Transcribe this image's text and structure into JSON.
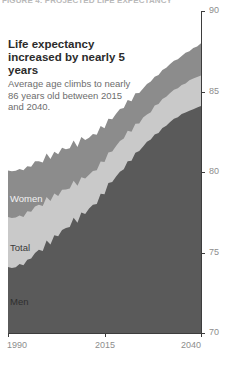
{
  "kicker": "FIGURE 4: PROJECTED LIFE EXPECTANCY",
  "headline": "Life expectancy increased by nearly 5 years",
  "deck": "Average age climbs to nearly 86 years old between 2015 and 2040.",
  "colors": {
    "women_band": "#8c8c8c",
    "total_band": "#c9c9c9",
    "men_band": "#5a5a5a",
    "axis": "#3d3d3d",
    "tick_label": "#8d8d8d",
    "headline_text": "#2b2b2b",
    "deck_text": "#6d6d6d",
    "background": "#ffffff"
  },
  "chart_data": {
    "type": "area",
    "title": "Life expectancy increased by nearly 5 years",
    "subtitle": "Average age climbs to nearly 86 years old between 2015 and 2040.",
    "xlabel": "",
    "ylabel": "",
    "xlim": [
      1990,
      2040
    ],
    "ylim": [
      70,
      90
    ],
    "xticks": [
      1990,
      2015,
      2040
    ],
    "yticks": [
      70,
      75,
      80,
      85,
      90
    ],
    "grid": false,
    "legend": "in-plot labels",
    "stacked": false,
    "note": "Three overlapping filled areas drawn back-to-front: Women (topmost, medium gray), Total (light gray), Men (darkest gray, frontmost).",
    "x": [
      1990,
      1991,
      1992,
      1993,
      1994,
      1995,
      1996,
      1997,
      1998,
      1999,
      2000,
      2001,
      2002,
      2003,
      2004,
      2005,
      2006,
      2007,
      2008,
      2009,
      2010,
      2011,
      2012,
      2013,
      2014,
      2015,
      2016,
      2017,
      2018,
      2019,
      2020,
      2021,
      2022,
      2023,
      2024,
      2025,
      2026,
      2027,
      2028,
      2029,
      2030,
      2031,
      2032,
      2033,
      2034,
      2035,
      2036,
      2037,
      2038,
      2039,
      2040
    ],
    "series": [
      {
        "name": "Women",
        "color": "#8c8c8c",
        "values": [
          80.1,
          80.0,
          80.3,
          80.1,
          80.4,
          80.3,
          80.5,
          80.7,
          80.6,
          80.7,
          80.9,
          80.9,
          81.0,
          81.1,
          81.4,
          81.3,
          81.6,
          81.8,
          81.8,
          82.1,
          82.2,
          82.2,
          82.4,
          82.5,
          82.7,
          82.9,
          83.1,
          83.3,
          83.5,
          83.8,
          84.0,
          84.3,
          84.5,
          84.8,
          85.0,
          85.2,
          85.5,
          85.7,
          85.9,
          86.1,
          86.3,
          86.5,
          86.7,
          86.9,
          87.0,
          87.2,
          87.4,
          87.5,
          87.7,
          87.8,
          88.0
        ]
      },
      {
        "name": "Total",
        "color": "#c9c9c9",
        "values": [
          77.2,
          77.1,
          77.4,
          77.2,
          77.5,
          77.5,
          77.7,
          77.9,
          77.9,
          78.0,
          78.2,
          78.3,
          78.4,
          78.5,
          78.8,
          78.8,
          79.1,
          79.3,
          79.4,
          79.6,
          79.8,
          79.9,
          80.1,
          80.3,
          80.5,
          80.8,
          81.0,
          81.3,
          81.5,
          81.8,
          82.1,
          82.4,
          82.6,
          82.9,
          83.1,
          83.4,
          83.6,
          83.8,
          84.1,
          84.3,
          84.5,
          84.7,
          84.9,
          85.1,
          85.2,
          85.4,
          85.5,
          85.7,
          85.8,
          85.9,
          86.0
        ]
      },
      {
        "name": "Men",
        "color": "#5a5a5a",
        "values": [
          74.1,
          74.0,
          74.3,
          74.2,
          74.5,
          74.5,
          74.8,
          75.0,
          75.1,
          75.2,
          75.5,
          75.6,
          75.8,
          76.0,
          76.3,
          76.4,
          76.7,
          77.0,
          77.1,
          77.4,
          77.6,
          77.8,
          78.0,
          78.2,
          78.5,
          78.8,
          79.1,
          79.4,
          79.6,
          79.9,
          80.2,
          80.5,
          80.8,
          81.1,
          81.4,
          81.6,
          81.9,
          82.1,
          82.3,
          82.5,
          82.7,
          82.9,
          83.1,
          83.3,
          83.4,
          83.6,
          83.7,
          83.8,
          83.9,
          84.0,
          84.1
        ]
      }
    ],
    "series_labels": [
      {
        "name": "Women",
        "text": "Women"
      },
      {
        "name": "Total",
        "text": "Total"
      },
      {
        "name": "Men",
        "text": "Men"
      }
    ]
  }
}
